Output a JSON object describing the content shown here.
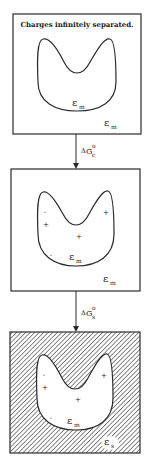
{
  "diagram": {
    "type": "thermodynamic-cycle-schematic",
    "boxes": [
      {
        "id": "state-1",
        "caption": "Charges infinitely separated.",
        "cavity_label": {
          "symbol": "ε",
          "subscript": "m"
        },
        "medium_label": {
          "symbol": "ε",
          "subscript": "m"
        },
        "hatched": false,
        "charges": []
      },
      {
        "id": "state-2",
        "cavity_label": {
          "symbol": "ε",
          "subscript": "m"
        },
        "medium_label": {
          "symbol": "ε",
          "subscript": "m"
        },
        "hatched": false,
        "charges": [
          "-",
          "+",
          "+",
          "+",
          "-"
        ]
      },
      {
        "id": "state-3",
        "cavity_label": {
          "symbol": "ε",
          "subscript": "m"
        },
        "medium_label": {
          "symbol": "ε",
          "subscript": "s"
        },
        "hatched": true,
        "charges": [
          "-",
          "+",
          "+",
          "+",
          "-"
        ]
      }
    ],
    "arrows": [
      {
        "from": "state-1",
        "to": "state-2",
        "label": {
          "prefix": "Δ",
          "symbol": "G",
          "subscript": "c",
          "superscript": "o"
        }
      },
      {
        "from": "state-2",
        "to": "state-3",
        "label": {
          "prefix": "Δ",
          "symbol": "G",
          "subscript": "s",
          "superscript": "o"
        }
      }
    ]
  }
}
